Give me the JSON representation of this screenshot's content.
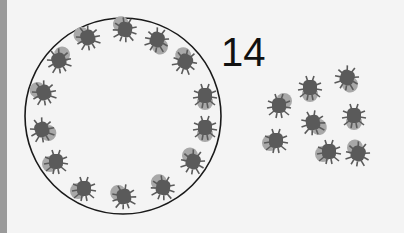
{
  "label": {
    "count": "14"
  },
  "colors": {
    "background": "#f4f4f4",
    "edge_bar": "#9a9a9a",
    "circle_stroke": "#1a1a1a",
    "bug_body": "#5a5a5a",
    "bug_shell": "#a8a8a8"
  },
  "circle": {
    "cx": 123,
    "cy": 116,
    "r": 98
  },
  "circle_bugs": [
    {
      "x": 88,
      "y": 38,
      "rot": -20,
      "shell": "tl"
    },
    {
      "x": 125,
      "y": 30,
      "rot": 10,
      "shell": "tl"
    },
    {
      "x": 157,
      "y": 40,
      "rot": 20,
      "shell": "br"
    },
    {
      "x": 185,
      "y": 62,
      "rot": 30,
      "shell": "tl"
    },
    {
      "x": 205,
      "y": 96,
      "rot": 0,
      "shell": "b"
    },
    {
      "x": 205,
      "y": 128,
      "rot": 0,
      "shell": "b"
    },
    {
      "x": 193,
      "y": 162,
      "rot": 20,
      "shell": "tl"
    },
    {
      "x": 163,
      "y": 188,
      "rot": 10,
      "shell": "tl"
    },
    {
      "x": 124,
      "y": 197,
      "rot": -10,
      "shell": "tl"
    },
    {
      "x": 84,
      "y": 189,
      "rot": 0,
      "shell": "l"
    },
    {
      "x": 56,
      "y": 162,
      "rot": 0,
      "shell": "l"
    },
    {
      "x": 42,
      "y": 130,
      "rot": -20,
      "shell": "br"
    },
    {
      "x": 44,
      "y": 93,
      "rot": -20,
      "shell": "tl"
    },
    {
      "x": 59,
      "y": 61,
      "rot": -20,
      "shell": "tr"
    }
  ],
  "outside_bugs": [
    {
      "x": 310,
      "y": 88,
      "rot": 0,
      "shell": "b"
    },
    {
      "x": 347,
      "y": 78,
      "rot": 20,
      "shell": "br"
    },
    {
      "x": 279,
      "y": 106,
      "rot": 0,
      "shell": "tr"
    },
    {
      "x": 313,
      "y": 123,
      "rot": -10,
      "shell": "br"
    },
    {
      "x": 354,
      "y": 116,
      "rot": 0,
      "shell": "b"
    },
    {
      "x": 276,
      "y": 141,
      "rot": 0,
      "shell": "l"
    },
    {
      "x": 329,
      "y": 152,
      "rot": 0,
      "shell": "l"
    },
    {
      "x": 358,
      "y": 154,
      "rot": 20,
      "shell": "tl"
    }
  ]
}
